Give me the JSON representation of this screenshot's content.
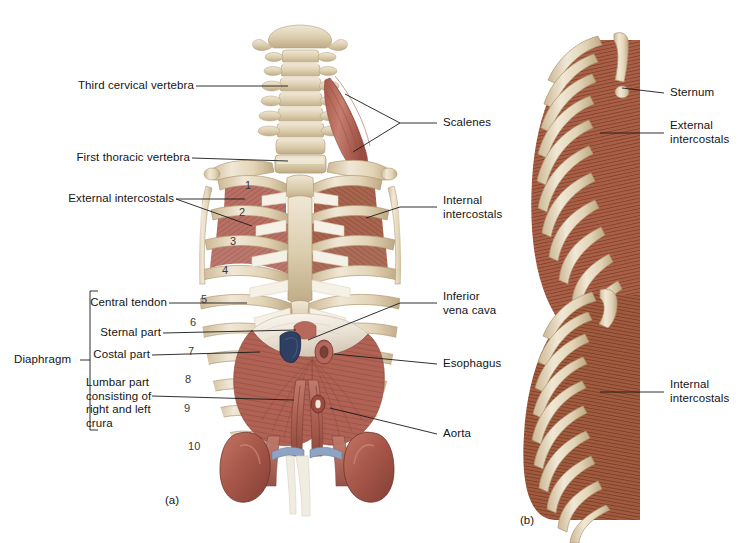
{
  "figure": {
    "panels": [
      {
        "id": "a",
        "caption": "(a)",
        "view": "Anterior view of thorax and diaphragm"
      },
      {
        "id": "b",
        "caption": "(b)",
        "view": "Lateral views of rib cage intercostal muscles"
      }
    ]
  },
  "labels_left": [
    {
      "name": "third-cervical-vertebra",
      "text": "Third cervical vertebra"
    },
    {
      "name": "first-thoracic-vertebra",
      "text": "First thoracic vertebra"
    },
    {
      "name": "external-intercostals",
      "text": "External intercostals"
    },
    {
      "name": "central-tendon",
      "text": "Central tendon"
    },
    {
      "name": "sternal-part",
      "text": "Sternal part"
    },
    {
      "name": "costal-part",
      "text": "Costal part"
    },
    {
      "name": "lumbar-part",
      "text": "Lumbar part\nconsisting of\nright and left\ncrura"
    },
    {
      "name": "diaphragm-group",
      "text": "Diaphragm"
    }
  ],
  "labels_right_a": [
    {
      "name": "scalenes",
      "text": "Scalenes"
    },
    {
      "name": "internal-intercostals",
      "text": "Internal\nintercostals"
    },
    {
      "name": "inferior-vena-cava",
      "text": "Inferior\nvena cava"
    },
    {
      "name": "esophagus",
      "text": "Esophagus"
    },
    {
      "name": "aorta",
      "text": "Aorta"
    }
  ],
  "labels_right_b": [
    {
      "name": "sternum",
      "text": "Sternum"
    },
    {
      "name": "external-intercostals-b",
      "text": "External\nintercostals"
    },
    {
      "name": "internal-intercostals-b",
      "text": "Internal\nintercostals"
    }
  ],
  "rib_numbers": [
    "1",
    "2",
    "3",
    "4",
    "5",
    "6",
    "7",
    "8",
    "9",
    "10"
  ],
  "captions": {
    "panel_a": "(a)",
    "panel_b": "(b)"
  },
  "colors": {
    "background": "#ffffff",
    "text": "#141414",
    "leader_line": "#1a1a1a",
    "bone_light": "#e8dcc4",
    "bone_mid": "#d8c7a6",
    "bone_shadow": "#bda883",
    "bone_highlight": "#f3ebd9",
    "cartilage": "#f4f0e6",
    "muscle_red": "#b5685c",
    "muscle_red_dark": "#8d4a42",
    "muscle_red_light": "#c98578",
    "intercostal_brown": "#a35c44",
    "intercostal_dark": "#7d4030",
    "tendon_white": "#f2ece4",
    "tendon_shadow": "#ddd2c4",
    "vein_blue": "#2e3f63",
    "vessel_blue": "#8fa3c4",
    "kidney": "#a4564a",
    "kidney_light": "#c0705f",
    "aorta_red": "#9c4a3e"
  }
}
